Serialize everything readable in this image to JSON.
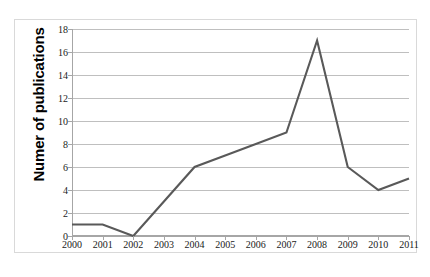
{
  "chart_data": {
    "type": "line",
    "title": "",
    "xlabel": "",
    "ylabel": "Numer of publications",
    "categories": [
      "2000",
      "2001",
      "2002",
      "2003",
      "2004",
      "2005",
      "2006",
      "2007",
      "2008",
      "2009",
      "2010",
      "2011"
    ],
    "values": [
      1,
      1,
      0,
      3,
      6,
      7,
      8,
      9,
      17,
      6,
      4,
      5
    ],
    "series": [
      {
        "name": "Numer of publications",
        "values": [
          1,
          1,
          0,
          3,
          6,
          7,
          8,
          9,
          17,
          6,
          4,
          5
        ]
      }
    ],
    "ylim": [
      0,
      18
    ],
    "y_ticks": [
      0,
      2,
      4,
      6,
      8,
      10,
      12,
      14,
      16,
      18
    ],
    "y_tick_labels": [
      "0",
      "2",
      "4",
      "6",
      "8",
      "10",
      "12",
      "14",
      "16",
      "18"
    ],
    "x_tick_labels": [
      "2000",
      "2001",
      "2002",
      "2003",
      "2004",
      "2005",
      "2006",
      "2007",
      "2008",
      "2009",
      "2010",
      "2011"
    ],
    "grid": true,
    "grid_axis": "y",
    "legend": false,
    "legend_position": "none",
    "markers": false,
    "line_color": "#595959",
    "grid_color": "#bfbfbf",
    "axis_color": "#a6a6a6",
    "border_color": "#d9d9d9",
    "background_color": "#ffffff",
    "text_color": "#1a1a1a"
  }
}
